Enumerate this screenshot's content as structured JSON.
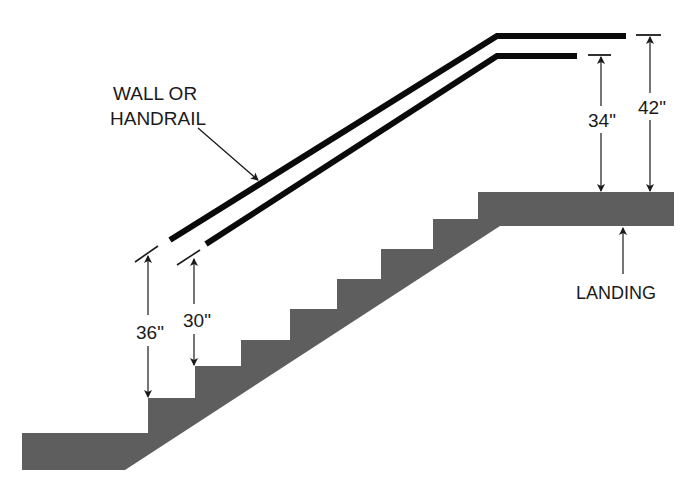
{
  "diagram": {
    "type": "stair-handrail-elevation",
    "colors": {
      "background": "#ffffff",
      "stair_fill": "#5e5e5e",
      "rail": "#0a0a0a",
      "line": "#1a1a1a",
      "text": "#1a1a1a"
    },
    "labels": {
      "rail_line1": "WALL OR",
      "rail_line2": "HANDRAIL",
      "landing": "LANDING"
    },
    "dimensions": {
      "guard_on_stair": "36\"",
      "handrail_on_stair": "30\"",
      "handrail_on_landing": "34\"",
      "guard_on_landing": "42\""
    },
    "stair": {
      "step_count": 7,
      "has_bottom_floor": true,
      "has_top_landing": true
    }
  }
}
